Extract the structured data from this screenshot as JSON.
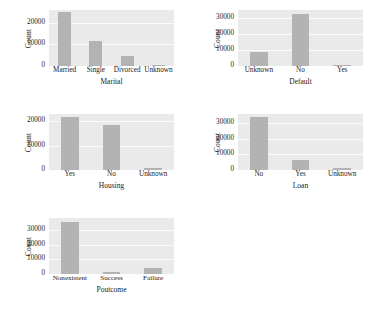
{
  "figure": {
    "ylabel": "Count",
    "grid_rows": 3,
    "grid_cols": 2,
    "panel_count": 5,
    "bar_color": "#b3b3b3",
    "plot_background": "#eaeaea",
    "gridline_color": "#fbfbfb",
    "text_color": "#1a1a1a"
  },
  "chart_data": [
    {
      "type": "bar",
      "title": "",
      "xlabel": "Marital",
      "ylabel": "Count",
      "categories": [
        "Married",
        "Single",
        "Divorced",
        "Unknown"
      ],
      "values": [
        24928,
        11568,
        4612,
        80
      ],
      "ylim": [
        0,
        26000
      ],
      "yticks": [
        0,
        10000,
        20000
      ],
      "ytick_labels": [
        "0",
        "10000",
        "20000"
      ],
      "grid": true,
      "legend": "none"
    },
    {
      "type": "bar",
      "title": "",
      "xlabel": "Default",
      "ylabel": "Count",
      "categories": [
        "Unknown",
        "No",
        "Yes"
      ],
      "values": [
        8597,
        32588,
        3
      ],
      "ylim": [
        0,
        35000
      ],
      "yticks": [
        0,
        10000,
        20000,
        30000
      ],
      "ytick_labels": [
        "0",
        "10000",
        "20000",
        "30000"
      ],
      "grid": true,
      "legend": "none"
    },
    {
      "type": "bar",
      "title": "",
      "xlabel": "Housing",
      "ylabel": "Count",
      "categories": [
        "Yes",
        "No",
        "Unknown"
      ],
      "values": [
        21576,
        18622,
        990
      ],
      "ylim": [
        0,
        23000
      ],
      "yticks": [
        0,
        10000,
        20000
      ],
      "ytick_labels": [
        "0",
        "10000",
        "20000"
      ],
      "grid": true,
      "legend": "none"
    },
    {
      "type": "bar",
      "title": "",
      "xlabel": "Loan",
      "ylabel": "Count",
      "categories": [
        "No",
        "Yes",
        "Unknown"
      ],
      "values": [
        33950,
        6248,
        990
      ],
      "ylim": [
        0,
        36000
      ],
      "yticks": [
        0,
        10000,
        20000,
        30000
      ],
      "ytick_labels": [
        "0",
        "10000",
        "20000",
        "30000"
      ],
      "grid": true,
      "legend": "none"
    },
    {
      "type": "bar",
      "title": "",
      "xlabel": "Poutcome",
      "ylabel": "Count",
      "categories": [
        "Nonexistent",
        "Success",
        "Failure"
      ],
      "values": [
        35563,
        1373,
        4252
      ],
      "ylim": [
        0,
        38000
      ],
      "yticks": [
        0,
        10000,
        20000,
        30000
      ],
      "ytick_labels": [
        "0",
        "10000",
        "20000",
        "30000"
      ],
      "grid": true,
      "legend": "none"
    }
  ]
}
